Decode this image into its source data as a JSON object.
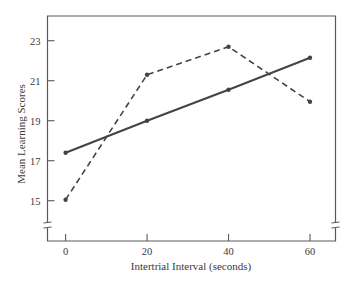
{
  "chart_data": {
    "type": "line",
    "title": "",
    "xlabel": "Intertrial Interval (seconds)",
    "ylabel": "Mean Learning Scores",
    "x": [
      0,
      20,
      40,
      60
    ],
    "xticks": [
      "0",
      "20",
      "40",
      "60"
    ],
    "yticks": [
      "15",
      "17",
      "19",
      "21",
      "23"
    ],
    "xlim": [
      -6.5,
      66.5
    ],
    "ylim": [
      13.0,
      24.25
    ],
    "axis_breaks": [
      "y-axis-bottom-left",
      "y-axis-bottom-right"
    ],
    "grid": false,
    "legend": "none",
    "series": [
      {
        "name": "solid-line",
        "style": "solid",
        "color": "#444444",
        "values": [
          17.4,
          19.0,
          20.55,
          22.15
        ]
      },
      {
        "name": "dashed-line",
        "style": "dashed",
        "color": "#444444",
        "values": [
          15.05,
          21.3,
          22.7,
          19.95
        ]
      }
    ]
  }
}
